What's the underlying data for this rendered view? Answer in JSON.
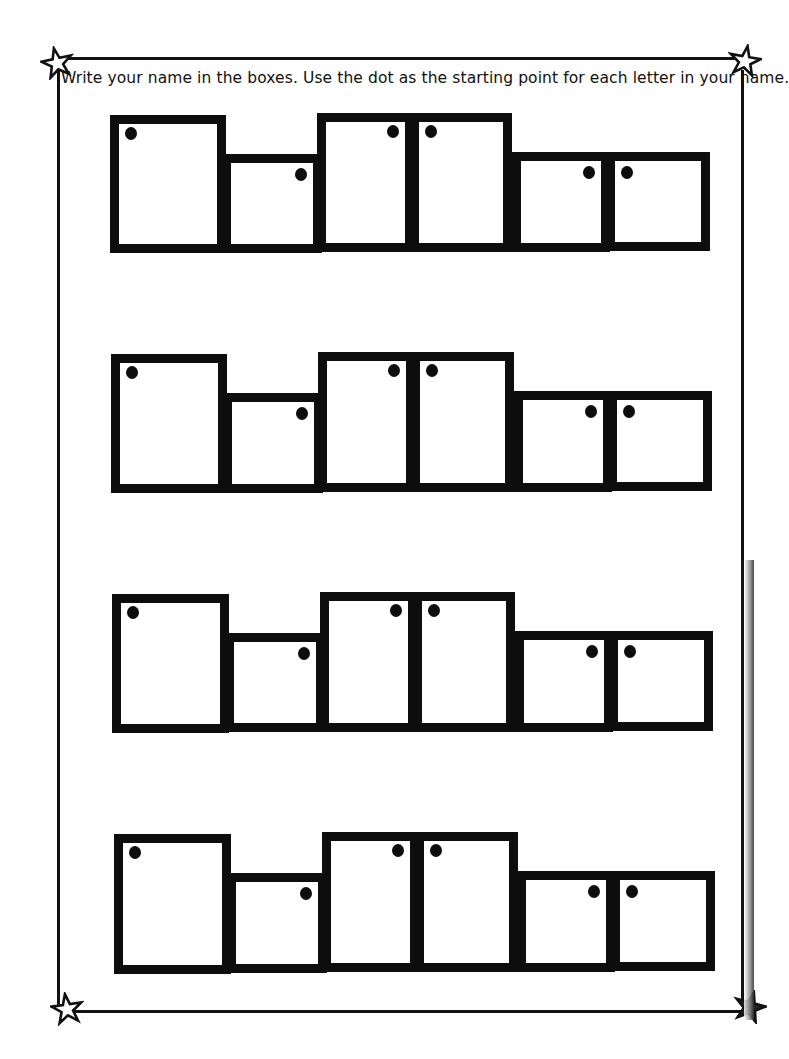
{
  "worksheet": {
    "instructions": "Write your name in the boxes. Use the dot as the starting point for each letter in your name.",
    "rows": [
      {
        "label": "row-1",
        "boxes": [
          {
            "left": 110,
            "top": 115,
            "width": 116,
            "height": 138,
            "dot": "top-left"
          },
          {
            "left": 222,
            "top": 154,
            "width": 100,
            "height": 99,
            "dot": "top-right"
          },
          {
            "left": 317,
            "top": 113,
            "width": 97,
            "height": 139,
            "dot": "top-right"
          },
          {
            "left": 410,
            "top": 113,
            "width": 102,
            "height": 139,
            "dot": "top-left"
          },
          {
            "left": 512,
            "top": 152,
            "width": 98,
            "height": 100,
            "dot": "top-right"
          },
          {
            "left": 606,
            "top": 152,
            "width": 104,
            "height": 99,
            "dot": "top-left"
          }
        ]
      },
      {
        "label": "row-2",
        "boxes": [
          {
            "left": 111,
            "top": 354,
            "width": 116,
            "height": 139,
            "dot": "top-left"
          },
          {
            "left": 223,
            "top": 393,
            "width": 100,
            "height": 100,
            "dot": "top-right"
          },
          {
            "left": 318,
            "top": 352,
            "width": 97,
            "height": 140,
            "dot": "top-right"
          },
          {
            "left": 411,
            "top": 352,
            "width": 103,
            "height": 140,
            "dot": "top-left"
          },
          {
            "left": 514,
            "top": 391,
            "width": 98,
            "height": 101,
            "dot": "top-right"
          },
          {
            "left": 608,
            "top": 391,
            "width": 104,
            "height": 100,
            "dot": "top-left"
          }
        ]
      },
      {
        "label": "row-3",
        "boxes": [
          {
            "left": 112,
            "top": 594,
            "width": 117,
            "height": 139,
            "dot": "top-left"
          },
          {
            "left": 225,
            "top": 633,
            "width": 100,
            "height": 99,
            "dot": "top-right"
          },
          {
            "left": 320,
            "top": 592,
            "width": 97,
            "height": 140,
            "dot": "top-right"
          },
          {
            "left": 413,
            "top": 592,
            "width": 102,
            "height": 140,
            "dot": "top-left"
          },
          {
            "left": 515,
            "top": 631,
            "width": 98,
            "height": 101,
            "dot": "top-right"
          },
          {
            "left": 609,
            "top": 631,
            "width": 104,
            "height": 100,
            "dot": "top-left"
          }
        ]
      },
      {
        "label": "row-4",
        "boxes": [
          {
            "left": 114,
            "top": 834,
            "width": 117,
            "height": 140,
            "dot": "top-left"
          },
          {
            "left": 227,
            "top": 873,
            "width": 100,
            "height": 100,
            "dot": "top-right"
          },
          {
            "left": 322,
            "top": 832,
            "width": 97,
            "height": 140,
            "dot": "top-right"
          },
          {
            "left": 415,
            "top": 832,
            "width": 103,
            "height": 140,
            "dot": "top-left"
          },
          {
            "left": 517,
            "top": 871,
            "width": 98,
            "height": 101,
            "dot": "top-right"
          },
          {
            "left": 611,
            "top": 871,
            "width": 104,
            "height": 100,
            "dot": "top-left"
          }
        ]
      }
    ]
  },
  "decorations": {
    "corner_icons": [
      "star-icon",
      "star-icon",
      "star-icon",
      "star-icon"
    ],
    "border_color": "#111111",
    "box_color": "#0d0d0d",
    "background": "#ffffff"
  }
}
